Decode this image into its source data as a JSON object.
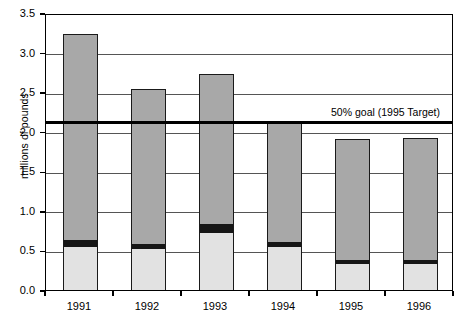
{
  "chart_data": {
    "type": "bar",
    "stacked": true,
    "title": "",
    "subtitle": "",
    "xlabel": "",
    "ylabel": "millions of pounds",
    "categories": [
      "1991",
      "1992",
      "1993",
      "1994",
      "1995",
      "1996"
    ],
    "ylim": [
      0.0,
      3.5
    ],
    "ytick_interval": 0.5,
    "ytick_labels": [
      "0.0",
      "0.5",
      "1.0",
      "1.5",
      "2.0",
      "2.5",
      "3.0",
      "3.5"
    ],
    "ytick_values": [
      0.0,
      0.5,
      1.0,
      1.5,
      2.0,
      2.5,
      3.0,
      3.5
    ],
    "grid": "horizontal",
    "legend": "none",
    "series": [
      {
        "name": "bottom-segment",
        "color": "#e2e2e2",
        "values": [
          0.55,
          0.53,
          0.73,
          0.56,
          0.34,
          0.34
        ]
      },
      {
        "name": "middle-segment",
        "color": "#161616",
        "values": [
          0.09,
          0.07,
          0.12,
          0.06,
          0.05,
          0.05
        ]
      },
      {
        "name": "top-segment",
        "color": "#a8a8a8",
        "values": [
          2.59,
          1.94,
          1.88,
          1.52,
          1.52,
          1.53
        ]
      }
    ],
    "totals": [
      3.23,
      2.54,
      2.73,
      2.14,
      1.91,
      1.92
    ],
    "annotations": [
      {
        "name": "goal-line",
        "label": "50% goal (1995 Target)",
        "value": 2.14,
        "style": "thick-horizontal-line",
        "color": "#000000"
      }
    ]
  }
}
